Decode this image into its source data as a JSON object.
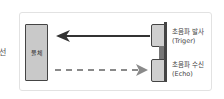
{
  "edge_text": "선",
  "diagram": {
    "object_label": "물체",
    "trigger": {
      "line1": "초음파 발사",
      "line2": "(Triger)"
    },
    "echo": {
      "line1": "초음파 수신",
      "line2": "(Echo)"
    },
    "colors": {
      "solid_arrow": "#333333",
      "dashed_arrow": "#8a8a8a",
      "object_fill": "#c9c9c9",
      "sensor_fill": "#cfcfcf",
      "frame_border": "#e2e2e2"
    }
  }
}
